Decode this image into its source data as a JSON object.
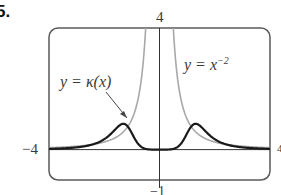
{
  "problem_number": "5.",
  "chart_data": {
    "type": "line",
    "title": "",
    "xlabel": "",
    "ylabel": "",
    "xlim": [
      -4,
      4
    ],
    "ylim": [
      -1,
      4
    ],
    "grid": false,
    "tick_labels": {
      "x_left": "−4",
      "x_right": "4",
      "y_top": "4",
      "y_bottom": "−1"
    },
    "series": [
      {
        "name": "y = x^-2",
        "label": "y = x",
        "label_exp": "−2",
        "color": "#a8a8a8",
        "formula": "x^-2",
        "sample_points": [
          [
            -4,
            0.0625
          ],
          [
            -2,
            0.25
          ],
          [
            -1,
            1.0
          ],
          [
            -0.5,
            4.0
          ],
          [
            0.5,
            4.0
          ],
          [
            1,
            1.0
          ],
          [
            2,
            0.25
          ],
          [
            4,
            0.0625
          ]
        ]
      },
      {
        "name": "y = κ(x)",
        "label": "y = κ(x)",
        "color": "#1a1a1a",
        "formula": "(6/x^4)/(1+4/x^6)^(3/2)",
        "sample_points": [
          [
            -4,
            0.023
          ],
          [
            -2,
            0.31
          ],
          [
            -1.3,
            0.85
          ],
          [
            -1,
            0.54
          ],
          [
            -0.5,
            0.0
          ],
          [
            0,
            0.0
          ],
          [
            0.5,
            0.0
          ],
          [
            1,
            0.54
          ],
          [
            1.3,
            0.85
          ],
          [
            2,
            0.31
          ],
          [
            4,
            0.023
          ]
        ]
      }
    ],
    "annotations": [
      {
        "text": "y = κ(x)",
        "arrow_to": [
          -1.3,
          0.85
        ]
      },
      {
        "text": "y = x^-2",
        "position": "upper right of y-axis"
      }
    ]
  }
}
